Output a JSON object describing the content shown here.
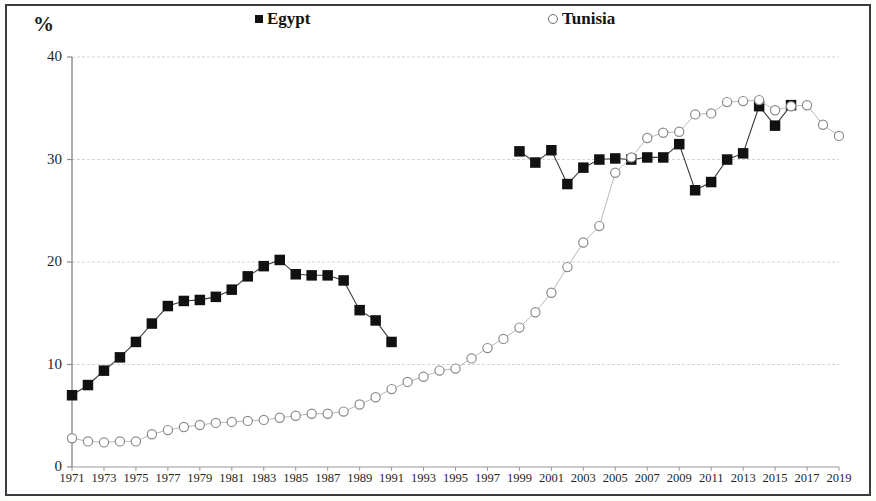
{
  "figure": {
    "border_color": "#3b3b3b",
    "background": "#ffffff"
  },
  "axis": {
    "y_title": "%",
    "y_ticks": [
      0,
      10,
      20,
      30,
      40
    ],
    "y_min": 0,
    "y_max": 40,
    "x_min": 1971,
    "x_max": 2019,
    "x_ticks": [
      1971,
      1973,
      1975,
      1977,
      1979,
      1981,
      1983,
      1985,
      1987,
      1989,
      1991,
      1993,
      1995,
      1997,
      1999,
      2001,
      2003,
      2005,
      2007,
      2009,
      2011,
      2013,
      2015,
      2017,
      2019
    ]
  },
  "legend": {
    "position": "top",
    "entries": [
      {
        "label": "Egypt",
        "marker": "filled-square",
        "color": "#111111"
      },
      {
        "label": "Tunisia",
        "marker": "open-circle",
        "color": "#6d6d6d"
      }
    ]
  },
  "chart_data": {
    "type": "line",
    "title": "",
    "subtitle": "",
    "xlabel": "",
    "ylabel": "%",
    "xlim": [
      1971,
      2019
    ],
    "ylim": [
      0,
      40
    ],
    "grid": "horizontal",
    "legend_position": "top",
    "series": [
      {
        "name": "Egypt",
        "marker": "filled-square",
        "color": "#111111",
        "points": [
          {
            "x": 1971,
            "y": 7.0
          },
          {
            "x": 1972,
            "y": 8.0
          },
          {
            "x": 1973,
            "y": 9.4
          },
          {
            "x": 1974,
            "y": 10.7
          },
          {
            "x": 1975,
            "y": 12.2
          },
          {
            "x": 1976,
            "y": 14.0
          },
          {
            "x": 1977,
            "y": 15.7
          },
          {
            "x": 1978,
            "y": 16.2
          },
          {
            "x": 1979,
            "y": 16.3
          },
          {
            "x": 1980,
            "y": 16.6
          },
          {
            "x": 1981,
            "y": 17.3
          },
          {
            "x": 1982,
            "y": 18.6
          },
          {
            "x": 1983,
            "y": 19.6
          },
          {
            "x": 1984,
            "y": 20.2
          },
          {
            "x": 1985,
            "y": 18.8
          },
          {
            "x": 1986,
            "y": 18.7
          },
          {
            "x": 1987,
            "y": 18.7
          },
          {
            "x": 1988,
            "y": 18.2
          },
          {
            "x": 1989,
            "y": 15.3
          },
          {
            "x": 1990,
            "y": 14.3
          },
          {
            "x": 1991,
            "y": 12.2
          },
          {
            "x": 1999,
            "y": 30.8
          },
          {
            "x": 2000,
            "y": 29.7
          },
          {
            "x": 2001,
            "y": 30.9
          },
          {
            "x": 2002,
            "y": 27.6
          },
          {
            "x": 2003,
            "y": 29.2
          },
          {
            "x": 2004,
            "y": 30.0
          },
          {
            "x": 2005,
            "y": 30.1
          },
          {
            "x": 2006,
            "y": 30.0
          },
          {
            "x": 2007,
            "y": 30.2
          },
          {
            "x": 2008,
            "y": 30.2
          },
          {
            "x": 2009,
            "y": 31.5
          },
          {
            "x": 2010,
            "y": 27.0
          },
          {
            "x": 2011,
            "y": 27.8
          },
          {
            "x": 2012,
            "y": 30.0
          },
          {
            "x": 2013,
            "y": 30.6
          },
          {
            "x": 2014,
            "y": 35.2
          },
          {
            "x": 2015,
            "y": 33.3
          },
          {
            "x": 2016,
            "y": 35.3
          }
        ]
      },
      {
        "name": "Tunisia",
        "marker": "open-circle",
        "color": "#6d6d6d",
        "points": [
          {
            "x": 1971,
            "y": 2.8
          },
          {
            "x": 1972,
            "y": 2.5
          },
          {
            "x": 1973,
            "y": 2.4
          },
          {
            "x": 1974,
            "y": 2.5
          },
          {
            "x": 1975,
            "y": 2.5
          },
          {
            "x": 1976,
            "y": 3.2
          },
          {
            "x": 1977,
            "y": 3.6
          },
          {
            "x": 1978,
            "y": 3.9
          },
          {
            "x": 1979,
            "y": 4.1
          },
          {
            "x": 1980,
            "y": 4.3
          },
          {
            "x": 1981,
            "y": 4.4
          },
          {
            "x": 1982,
            "y": 4.5
          },
          {
            "x": 1983,
            "y": 4.6
          },
          {
            "x": 1984,
            "y": 4.8
          },
          {
            "x": 1985,
            "y": 5.0
          },
          {
            "x": 1986,
            "y": 5.2
          },
          {
            "x": 1987,
            "y": 5.2
          },
          {
            "x": 1988,
            "y": 5.4
          },
          {
            "x": 1989,
            "y": 6.1
          },
          {
            "x": 1990,
            "y": 6.8
          },
          {
            "x": 1991,
            "y": 7.6
          },
          {
            "x": 1992,
            "y": 8.3
          },
          {
            "x": 1993,
            "y": 8.8
          },
          {
            "x": 1994,
            "y": 9.4
          },
          {
            "x": 1995,
            "y": 9.6
          },
          {
            "x": 1996,
            "y": 10.6
          },
          {
            "x": 1997,
            "y": 11.6
          },
          {
            "x": 1998,
            "y": 12.5
          },
          {
            "x": 1999,
            "y": 13.6
          },
          {
            "x": 2000,
            "y": 15.1
          },
          {
            "x": 2001,
            "y": 17.0
          },
          {
            "x": 2002,
            "y": 19.5
          },
          {
            "x": 2003,
            "y": 21.9
          },
          {
            "x": 2004,
            "y": 23.5
          },
          {
            "x": 2005,
            "y": 28.7
          },
          {
            "x": 2006,
            "y": 30.2
          },
          {
            "x": 2007,
            "y": 32.1
          },
          {
            "x": 2008,
            "y": 32.6
          },
          {
            "x": 2009,
            "y": 32.7
          },
          {
            "x": 2010,
            "y": 34.4
          },
          {
            "x": 2011,
            "y": 34.5
          },
          {
            "x": 2012,
            "y": 35.6
          },
          {
            "x": 2013,
            "y": 35.7
          },
          {
            "x": 2014,
            "y": 35.8
          },
          {
            "x": 2015,
            "y": 34.8
          },
          {
            "x": 2016,
            "y": 35.2
          },
          {
            "x": 2017,
            "y": 35.3
          },
          {
            "x": 2018,
            "y": 33.4
          },
          {
            "x": 2019,
            "y": 32.3
          }
        ]
      }
    ]
  }
}
